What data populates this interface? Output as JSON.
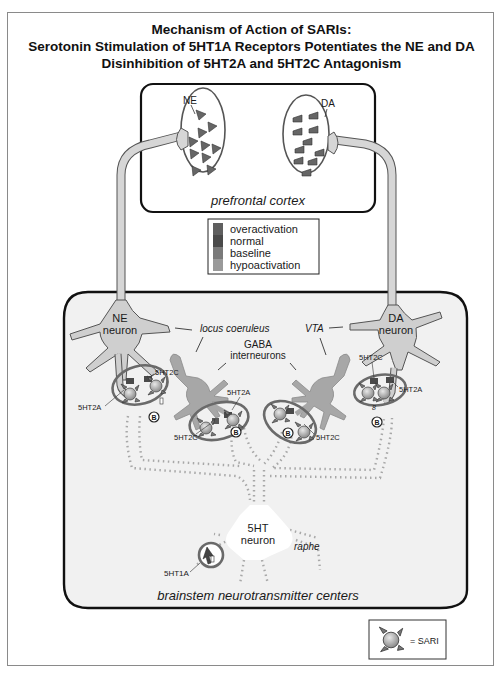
{
  "title": {
    "line1": "Mechanism of Action of SARIs:",
    "line2": "Serotonin Stimulation of 5HT1A Receptors Potentiates the NE and DA",
    "line3": "Disinhibition of 5HT2A and 5HT2C Antagonism"
  },
  "prefrontal": {
    "label": "prefrontal cortex",
    "ne_label": "NE",
    "da_label": "DA"
  },
  "legend": {
    "items": [
      {
        "label": "overactivation",
        "color": "#5f5f5f"
      },
      {
        "label": "normal",
        "color": "#4a4a4a"
      },
      {
        "label": "baseline",
        "color": "#7a7a7a"
      },
      {
        "label": "hypoactivation",
        "color": "#9a9a9a"
      }
    ]
  },
  "brainstem": {
    "label": "brainstem neurotransmitter centers",
    "ne_neuron_line1": "NE",
    "ne_neuron_line2": "neuron",
    "da_neuron_line1": "DA",
    "da_neuron_line2": "neuron",
    "locus": "locus coeruleus",
    "vta": "VTA",
    "gaba_line1": "GABA",
    "gaba_line2": "interneurons",
    "ht_neuron_line1": "5HT",
    "ht_neuron_line2": "neuron",
    "raphe": "raphe",
    "receptors": {
      "ne_2c": "5HT2C",
      "ne_2a": "5HT2A",
      "gaba_left_2a": "5HT2A",
      "gaba_left_2c": "5HT2C",
      "gaba_right_2c": "5HT2C",
      "da_2c": "5HT2C",
      "da_2a": "5HT2A",
      "ht_1a": "5HT1A"
    }
  },
  "key": {
    "label": "= SARI"
  },
  "colors": {
    "panel_bg": "#f1f1f1",
    "neuron_fill": "#cfcfcf",
    "gaba_fill": "#a7a7a7",
    "oval_stroke": "#5a5a5a",
    "dots": "#a8a8a8"
  }
}
